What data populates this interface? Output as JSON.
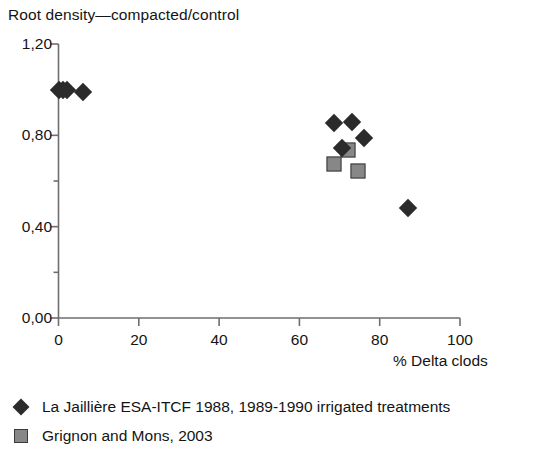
{
  "chart_data": {
    "type": "scatter",
    "title": "Root density—compacted/control",
    "xlabel": "% Delta clods",
    "ylabel": "",
    "xlim": [
      0,
      100
    ],
    "ylim": [
      0.0,
      1.2
    ],
    "grid": false,
    "legend_position": "below",
    "x_ticks": [
      "0",
      "20",
      "40",
      "60",
      "80",
      "100"
    ],
    "x_tick_values": [
      0,
      20,
      40,
      60,
      80,
      100
    ],
    "y_ticks": [
      "0,00",
      "0,40",
      "0,80",
      "1,20"
    ],
    "y_tick_values": [
      0.0,
      0.4,
      0.8,
      1.2
    ],
    "y_minor_tick_values": [
      0.2,
      0.6,
      1.0
    ],
    "series": [
      {
        "name": "La Jaillière ESA-ITCF 1988, 1989-1990 irrigated treatments",
        "marker": "diamond",
        "color": "#2b2b2b",
        "points": [
          {
            "x": 0.0,
            "y": 1.0
          },
          {
            "x": 1.0,
            "y": 1.0
          },
          {
            "x": 2.0,
            "y": 1.0
          },
          {
            "x": 6.0,
            "y": 0.99
          },
          {
            "x": 68.5,
            "y": 0.855
          },
          {
            "x": 73.0,
            "y": 0.86
          },
          {
            "x": 70.5,
            "y": 0.745
          },
          {
            "x": 76.0,
            "y": 0.79
          },
          {
            "x": 87.0,
            "y": 0.48
          }
        ]
      },
      {
        "name": "Grignon and Mons, 2003",
        "marker": "square",
        "color": "#878787",
        "points": [
          {
            "x": 72.0,
            "y": 0.735
          },
          {
            "x": 68.5,
            "y": 0.675
          },
          {
            "x": 74.5,
            "y": 0.645
          }
        ]
      }
    ]
  },
  "legend": {
    "items": [
      {
        "label": "La Jaillière ESA-ITCF 1988, 1989-1990 irrigated treatments",
        "marker": "diamond"
      },
      {
        "label": "Grignon and Mons, 2003",
        "marker": "square"
      }
    ]
  },
  "colors": {
    "axis": "#6e6e6e",
    "text": "#141414",
    "series_1": "#2b2b2b",
    "series_2": "#878787"
  }
}
